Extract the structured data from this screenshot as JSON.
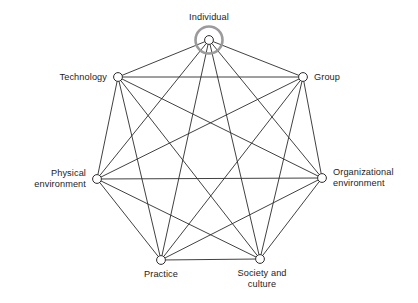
{
  "diagram": {
    "type": "complete-graph-heptagon",
    "title": "",
    "background_color": "#ffffff",
    "edge_color": "#2b2b2b",
    "edge_width": 0.9,
    "node_stroke_color": "#2b2b2b",
    "node_fill_color": "#ffffff",
    "node_radius": 4.4,
    "highlight_ring_color": "#9b9b9b",
    "highlight_ring_width": 2.6,
    "highlight_ring_radius": 13.5,
    "highlighted_node": "Individual",
    "edges_description": "every node connected to every other node",
    "edge_count": 21,
    "nodes": [
      {
        "id": "individual",
        "label": "Individual",
        "label_lines": [
          "Individual"
        ],
        "x": 209,
        "y": 40,
        "label_x": 209,
        "label_y": 12,
        "anchor": "center",
        "highlighted": true
      },
      {
        "id": "group",
        "label": "Group",
        "label_lines": [
          "Group"
        ],
        "x": 303,
        "y": 77,
        "label_x": 314,
        "label_y": 77,
        "anchor": "right",
        "highlighted": false
      },
      {
        "id": "organizational-environment",
        "label": "Organizational environment",
        "label_lines": [
          "Organizational",
          "environment"
        ],
        "x": 322,
        "y": 178,
        "label_x": 333,
        "label_y": 178,
        "anchor": "right",
        "highlighted": false
      },
      {
        "id": "society-and-culture",
        "label": "Society and culture",
        "label_lines": [
          "Society and",
          "culture"
        ],
        "x": 260,
        "y": 259,
        "label_x": 262,
        "label_y": 268,
        "anchor": "center",
        "highlighted": false
      },
      {
        "id": "practice",
        "label": "Practice",
        "label_lines": [
          "Practice"
        ],
        "x": 161,
        "y": 260,
        "label_x": 161,
        "label_y": 269,
        "anchor": "center",
        "highlighted": false
      },
      {
        "id": "physical-environment",
        "label": "Physical environment",
        "label_lines": [
          "Physical",
          "environment"
        ],
        "x": 97,
        "y": 179,
        "label_x": 86,
        "label_y": 179,
        "anchor": "left",
        "highlighted": false
      },
      {
        "id": "technology",
        "label": "Technology",
        "label_lines": [
          "Technology"
        ],
        "x": 118,
        "y": 77,
        "label_x": 107,
        "label_y": 77,
        "anchor": "left",
        "highlighted": false
      }
    ]
  }
}
